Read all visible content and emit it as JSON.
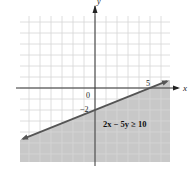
{
  "chart_data": {
    "type": "area",
    "title": "",
    "inequality": "2x − 5y ≥ 10",
    "boundary_line": {
      "equation": "2x − 5y = 10",
      "style": "solid",
      "points": [
        [
          -7,
          -4.8
        ],
        [
          7,
          0.8
        ]
      ],
      "x_intercept": 5,
      "y_intercept": -2
    },
    "shaded_region": "below line",
    "xlabel": "x",
    "ylabel": "y",
    "xlim": [
      -7,
      7
    ],
    "ylim": [
      -7,
      6.5
    ],
    "grid": true,
    "tick_labels": [
      {
        "axis": "x",
        "value": 5,
        "text": "5"
      },
      {
        "axis": "y",
        "value": -2,
        "text": "−2"
      },
      {
        "axis": "origin",
        "value": 0,
        "text": "0"
      }
    ],
    "colors": {
      "shade": "#c8c8c8",
      "grid": "#d6d6d6",
      "axis": "#333333",
      "line": "#555555"
    }
  },
  "labels": {
    "x_axis": "x",
    "y_axis": "y",
    "origin": "0",
    "x_tick_5": "5",
    "y_tick_neg2": "−2",
    "inequality": "2x − 5y ≥ 10"
  }
}
